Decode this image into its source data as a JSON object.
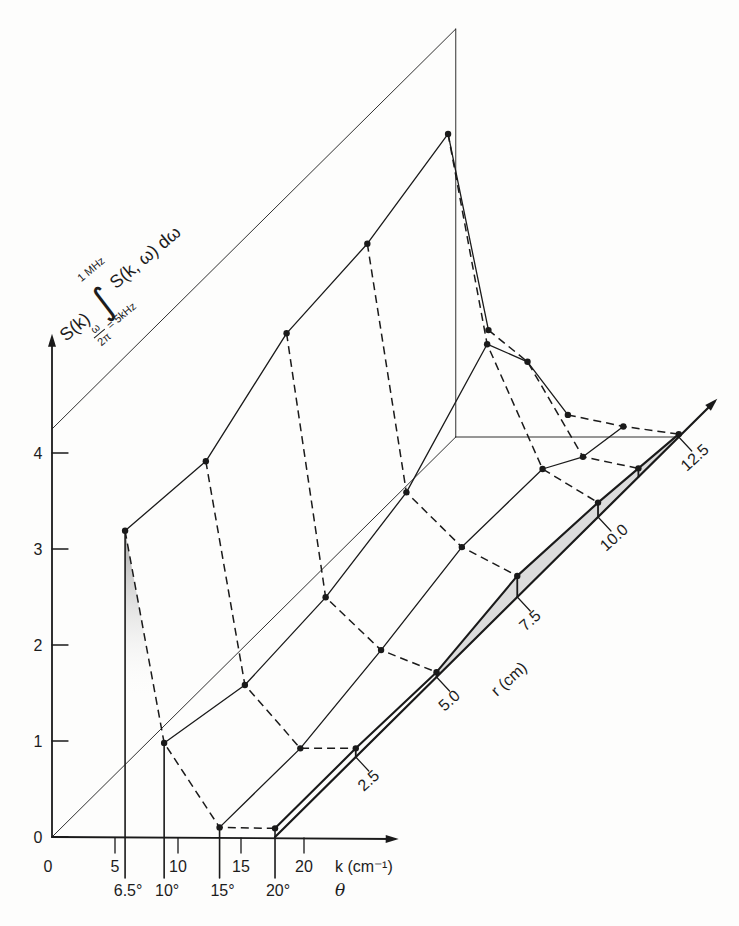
{
  "chart_data": {
    "type": "line",
    "projection": "3d-oblique",
    "title": "",
    "xlabel": "k (cm⁻¹)",
    "x_secondary_label": "θ",
    "ylabel": {
      "prefix": "S(k)",
      "integral": "∫",
      "upper_limit": "1 MHz",
      "lower_limit_num": "ω",
      "lower_limit_den": "2π",
      "lower_limit_value": "= 5kHz",
      "integrand": "S(k, ω) dω"
    },
    "zlabel": "r (cm)",
    "x_ticks": [
      "0",
      "5",
      "10",
      "15",
      "20"
    ],
    "x_tick_values": [
      0,
      5,
      10,
      15,
      20
    ],
    "y_ticks": [
      "0",
      "1",
      "2",
      "3",
      "4"
    ],
    "y_tick_values": [
      0,
      1,
      2,
      3,
      4
    ],
    "r_ticks": [
      "2.5",
      "5.0",
      "7.5",
      "10.0",
      "12.5"
    ],
    "r_tick_values": [
      2.5,
      5,
      7.5,
      10,
      12.5
    ],
    "theta_ticks": [
      "6.5°",
      "10°",
      "15°",
      "20°"
    ],
    "r_values": [
      0,
      2.5,
      5,
      7.5,
      10,
      11.25,
      12.5
    ],
    "series": [
      {
        "name": "6.5°",
        "k": 5.8,
        "values": [
          3.19,
          3.08,
          3.58,
          3.68,
          3.99,
          1.53,
          null
        ]
      },
      {
        "name": "10°",
        "k": 8.9,
        "values": [
          0.98,
          0.75,
          0.83,
          1.09,
          1.8,
          1.2,
          0.23
        ]
      },
      {
        "name": "15°",
        "k": 13.3,
        "values": [
          0.1,
          0.09,
          0.28,
          0.52,
          0.5,
          0.21,
          0.11
        ]
      },
      {
        "name": "20°",
        "k": 17.7,
        "values": [
          0.09,
          0.09,
          0.05,
          0.22,
          0.15,
          0.09,
          0.03
        ]
      }
    ],
    "line_styles": {
      "constant_theta": "solid",
      "constant_r": "dashed"
    },
    "xlim": [
      0,
      27.2
    ],
    "ylim": [
      0,
      5.2
    ],
    "rlim": [
      0,
      13.6
    ],
    "back_plane_height": 4.25,
    "back_plane_r": 12.5,
    "grid": false,
    "legend": "none",
    "colors": {
      "ink": "#1a1a1a",
      "shade": "#dcdcdc",
      "background": "#fdfdfc"
    }
  }
}
